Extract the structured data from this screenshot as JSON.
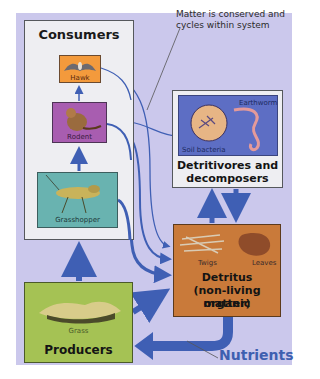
{
  "annotation": {
    "text": "Matter is conserved and cycles within system"
  },
  "consumers": {
    "title": "Consumers",
    "organisms": [
      {
        "label": "Hawk",
        "color": "#f39a3c"
      },
      {
        "label": "Rodent",
        "color": "#a85db0"
      },
      {
        "label": "Grasshopper",
        "color": "#69b3b0"
      }
    ]
  },
  "producers": {
    "title": "Producers",
    "organism": {
      "label": "Grass",
      "color": "#a5c254"
    }
  },
  "detritivores": {
    "title_line1": "Detritivores and",
    "title_line2": "decomposers",
    "organisms": [
      {
        "label": "Earthworm"
      },
      {
        "label": "Soil bacteria"
      }
    ],
    "inner_color": "#5d6ec4"
  },
  "detritus": {
    "title_line1": "Detritus",
    "title_line2": "(non-living organic",
    "title_line3": "matter)",
    "items": [
      {
        "label": "Twigs"
      },
      {
        "label": "Leaves"
      }
    ],
    "color": "#c97a3a"
  },
  "nutrients": {
    "label": "Nutrients",
    "color": "#3e5fb0"
  },
  "colors": {
    "panel": "#cbc8ec",
    "arrow": "#3f5fb4"
  }
}
